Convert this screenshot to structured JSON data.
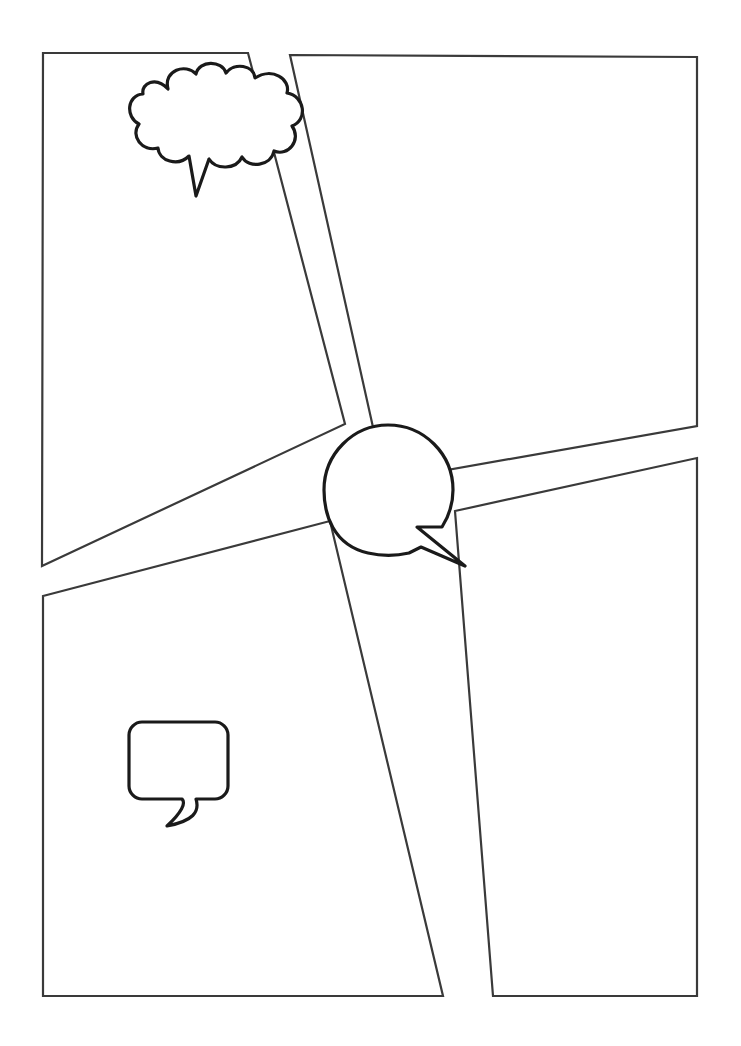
{
  "document": {
    "kind": "comic-page-template",
    "title": "",
    "width": 741,
    "height": 1046,
    "background_color": "#ffffff",
    "ink_color": "#2b2b2b",
    "balloon_ink_color": "#1a1a1a"
  },
  "panels": [
    {
      "id": "panel-top-left",
      "label": "",
      "stroke_color": "#3a3a3a",
      "stroke_width": 2.2,
      "points": "43,53 248,53 345,424 42,566"
    },
    {
      "id": "panel-top-right",
      "label": "",
      "stroke_color": "#3a3a3a",
      "stroke_width": 2.2,
      "points": "290,55 697,57 697,426 385,481"
    },
    {
      "id": "panel-bottom-left",
      "label": "",
      "stroke_color": "#3a3a3a",
      "stroke_width": 2.2,
      "points": "43,596 330,521 443,996 43,996"
    },
    {
      "id": "panel-bottom-right",
      "label": "",
      "stroke_color": "#3a3a3a",
      "stroke_width": 2.2,
      "points": "455,511 697,458 697,996 493,996"
    }
  ],
  "balloons": [
    {
      "id": "thought-cloud-balloon",
      "type": "thought-cloud",
      "text": "",
      "stroke_color": "#1a1a1a",
      "stroke_width": 3.0,
      "center": [
        214,
        118
      ],
      "tail_tip": [
        193,
        196
      ]
    },
    {
      "id": "round-speech-balloon",
      "type": "round",
      "text": "",
      "stroke_color": "#1a1a1a",
      "stroke_width": 3.0,
      "center": [
        388,
        490
      ],
      "radius": 65,
      "tail_tip": [
        465,
        566
      ]
    },
    {
      "id": "rect-speech-balloon",
      "type": "rounded-rect",
      "text": "",
      "stroke_color": "#1a1a1a",
      "stroke_width": 3.0,
      "rect": [
        129,
        722,
        99,
        77
      ],
      "corner_radius": 13,
      "tail_tip": [
        167,
        826
      ]
    }
  ]
}
